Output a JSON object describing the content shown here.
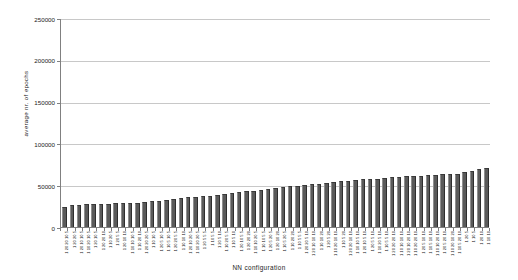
{
  "chart_data": {
    "type": "bar",
    "title": "",
    "xlabel": "NN configuration",
    "ylabel": "average nr. of epochs",
    "ylim": [
      0,
      250000
    ],
    "ytick_labels": [
      "0",
      "50000",
      "100000",
      "150000",
      "200000",
      "250000"
    ],
    "ytick_values": [
      0,
      50000,
      100000,
      150000,
      200000,
      250000
    ],
    "grid": true,
    "legend": "none",
    "bar_color": "#5a5a5a",
    "categories": [
      "1 20 20 10 5",
      "1 20 20 5",
      "1 20 10 10 5",
      "1 10 20 10 5",
      "1 20 10 5",
      "1 20 20 10",
      "1 10 20 5",
      "1 20 5 5",
      "1 20 10 10",
      "1 10 10 10 5",
      "1 10 20 10",
      "1 20 20 20 5",
      "1 10 10 5",
      "1 20 5 10 5",
      "1 10 5 10 5",
      "1 20 20 5 5",
      "1 10 10 10",
      "1 20 10 20 5",
      "1 10 20 20 5",
      "1 20 5 5 5",
      "1 10 5 5",
      "1 20 5 10",
      "1 10 20 5 5",
      "1 10 5 10",
      "1 20 10 5 5",
      "1 20 20 20",
      "1 10 10 20 5",
      "1 10 10 5 5",
      "1 20 5 20 5",
      "1 20 10 20",
      "1 10 5 20 5",
      "1 10 20 20",
      "1 10 5 5 5",
      "1 20 20 5 10",
      "1 20 10 10 10",
      "1 10 10 20",
      "1 20 5 20",
      "1 10 20 10 10",
      "1 10 5 20",
      "1 20 20 10 10",
      "1 10 10 5 10",
      "1 20 10 5 10",
      "1 20 5 5 10",
      "1 10 20 5 10",
      "1 10 5 5 10",
      "1 20 20 20 10",
      "1 10 10 10 10",
      "1 20 10 20 10",
      "1 10 20 20 10",
      "1 20 5 10 10",
      "1 10 5 10 10",
      "1 10 10 20 10",
      "1 20 5 20 10",
      "1 10 20 10 20",
      "1 10 5 20 10",
      "1 20 5",
      "1 10 5",
      "1 20 10",
      "1 10 10"
    ],
    "values": [
      24500,
      26000,
      26800,
      27200,
      27500,
      27800,
      28000,
      28200,
      28500,
      28800,
      29000,
      30500,
      31000,
      31500,
      32000,
      33500,
      34500,
      35500,
      36500,
      37000,
      37500,
      38500,
      39500,
      40500,
      41500,
      42500,
      43500,
      44500,
      45500,
      46500,
      47500,
      48500,
      49500,
      50500,
      51000,
      52000,
      53000,
      54000,
      54500,
      55500,
      56000,
      57000,
      57500,
      58000,
      58500,
      59500,
      60000,
      60500,
      61000,
      61500,
      62000,
      62500,
      63000,
      63500,
      64000,
      65500,
      67000,
      69000,
      70500
    ]
  }
}
